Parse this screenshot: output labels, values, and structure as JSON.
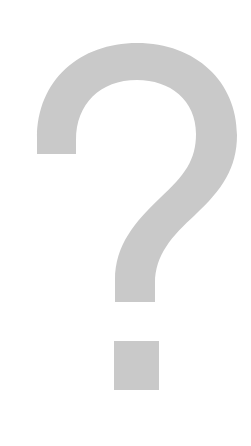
{
  "image": {
    "subject": "question-mark",
    "icon": "question-mark-icon",
    "glyph": "?",
    "colors": {
      "background": "#ffffff",
      "glyph": "#c9c9c9"
    }
  }
}
